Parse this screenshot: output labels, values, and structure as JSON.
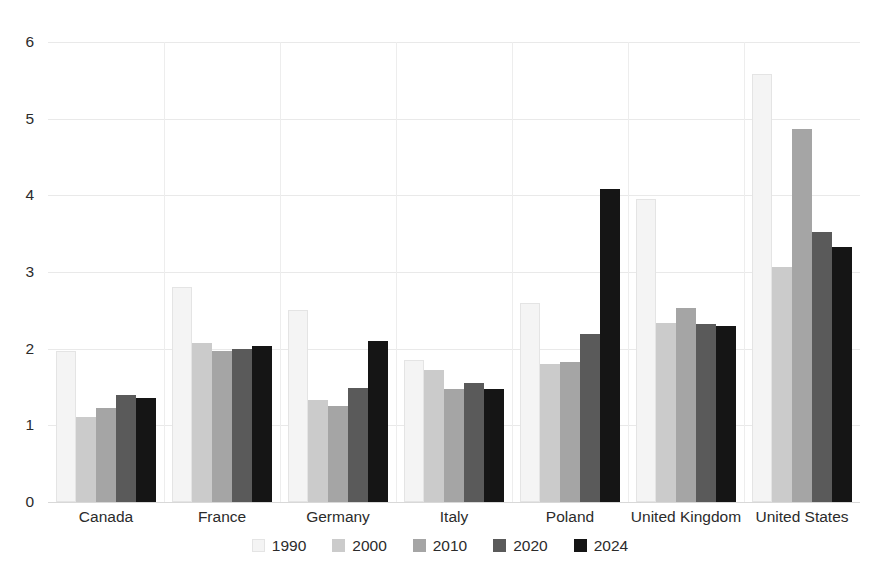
{
  "chart_data": {
    "type": "bar",
    "title": "",
    "subtitle": "",
    "xlabel": "",
    "ylabel": "",
    "ylim": [
      0,
      6
    ],
    "yticks": [
      0,
      1,
      2,
      3,
      4,
      5,
      6
    ],
    "ytick_labels": [
      "0",
      "1",
      "2",
      "3",
      "4",
      "5",
      "6"
    ],
    "grid": true,
    "legend_position": "bottom",
    "categories": [
      "Canada",
      "France",
      "Germany",
      "Italy",
      "Poland",
      "United Kingdom",
      "United States"
    ],
    "series": [
      {
        "name": "1990",
        "color": "#f4f4f4",
        "values": [
          1.97,
          2.8,
          2.5,
          1.85,
          2.6,
          3.95,
          5.58
        ]
      },
      {
        "name": "2000",
        "color": "#cbcbcb",
        "values": [
          1.11,
          2.07,
          1.33,
          1.72,
          1.8,
          2.34,
          3.06
        ]
      },
      {
        "name": "2010",
        "color": "#a5a5a5",
        "values": [
          1.22,
          1.97,
          1.25,
          1.48,
          1.82,
          2.53,
          4.86
        ]
      },
      {
        "name": "2020",
        "color": "#5a5a5a",
        "values": [
          1.4,
          2.0,
          1.49,
          1.55,
          2.19,
          2.32,
          3.52
        ]
      },
      {
        "name": "2024",
        "color": "#151515",
        "values": [
          1.36,
          2.04,
          2.1,
          1.47,
          4.08,
          2.29,
          3.33
        ]
      }
    ]
  },
  "legend": {
    "items": [
      {
        "label": "1990"
      },
      {
        "label": "2000"
      },
      {
        "label": "2010"
      },
      {
        "label": "2020"
      },
      {
        "label": "2024"
      }
    ]
  }
}
